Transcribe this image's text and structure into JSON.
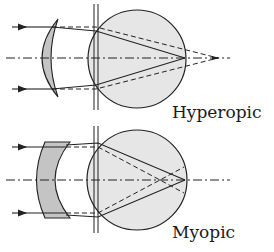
{
  "diagram": {
    "type": "optics",
    "panels": [
      {
        "id": "hyperopic",
        "label": "Hyperopic",
        "lens_type": "convex",
        "description": "Converging lens moves the focus from behind the retina onto the retina"
      },
      {
        "id": "myopic",
        "label": "Myopic",
        "lens_type": "concave",
        "description": "Diverging lens moves the focus from in front of the retina onto the retina"
      }
    ],
    "colors": {
      "stroke": "#222222",
      "eye_fill": "#e6e6e6",
      "lens_fill": "#c4c4c4",
      "background": "#ffffff"
    }
  }
}
